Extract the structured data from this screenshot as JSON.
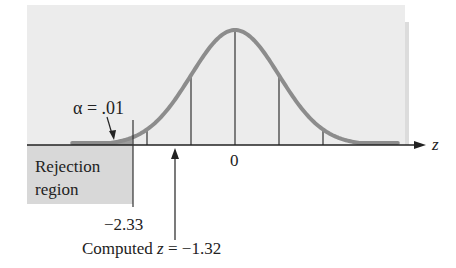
{
  "chart_data": {
    "type": "area",
    "title": "",
    "xlabel": "z",
    "ylabel": "",
    "x_range": [
      -3.4,
      3.4
    ],
    "distribution": "standard normal",
    "reference_lines_z": [
      -2,
      -1,
      0,
      1,
      2
    ],
    "tick_labels": [
      {
        "z": 0,
        "label": "0"
      }
    ],
    "critical_value": {
      "z": -2.33,
      "label": "−2.33"
    },
    "alpha": {
      "value": 0.01,
      "label": "α = .01"
    },
    "rejection_region": {
      "label_line1": "Rejection",
      "label_line2": "region",
      "from": "-inf",
      "to": -2.33
    },
    "computed_statistic": {
      "z": -1.32,
      "label": "Computed z = −1.32"
    },
    "colors": {
      "curve": "#8a8a8a",
      "panel": "#ececec",
      "rejection_box": "#d6d6d6",
      "tail_fill": "#9a9a9a",
      "axis": "#222222"
    }
  },
  "labels": {
    "alpha": "α = .01",
    "axis_var": "z",
    "zero": "0",
    "rejection_line1": "Rejection",
    "rejection_line2": "region",
    "critical": "−2.33",
    "computed_prefix": "Computed ",
    "computed_var": "z",
    "computed_suffix": " = −1.32"
  }
}
